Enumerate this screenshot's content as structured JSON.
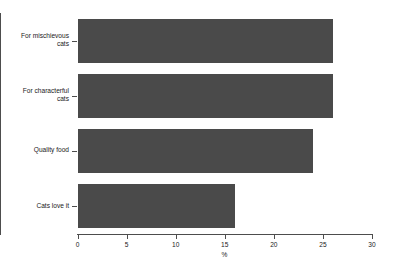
{
  "chart_data": {
    "type": "bar",
    "orientation": "horizontal",
    "title": "",
    "subtitle": "",
    "xlabel": "%",
    "ylabel": "",
    "categories": [
      "For mischievous\ncats",
      "For characterful\ncats",
      "Quality food",
      "Cats love it"
    ],
    "values": [
      26,
      26,
      24,
      16
    ],
    "xlim": [
      0,
      30
    ],
    "xticks": [
      0,
      5,
      10,
      15,
      20,
      25,
      30
    ],
    "xtick_labels": [
      "0",
      "5",
      "10",
      "15",
      "20",
      "25",
      "30"
    ],
    "grid": false,
    "legend": false,
    "bar_color": "#4a4a4a",
    "axis_color": "#4d4d4d",
    "background_color": "#ffffff"
  },
  "axis": {
    "x_title": "%"
  }
}
